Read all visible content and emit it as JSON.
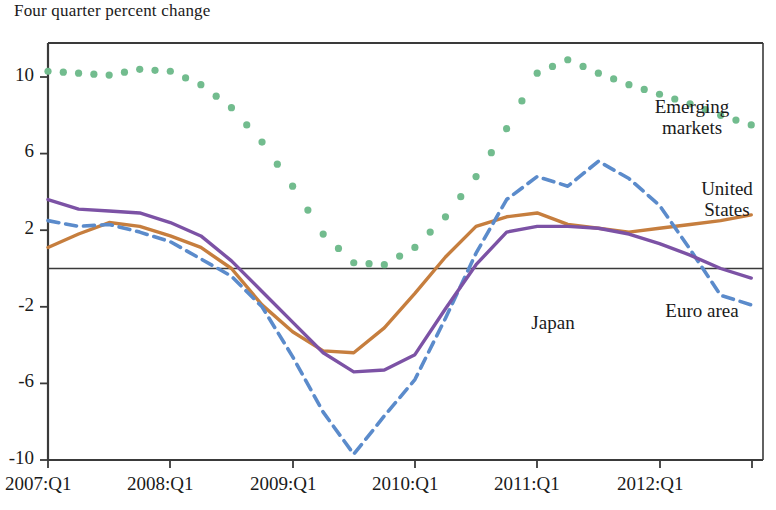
{
  "chart_data": {
    "type": "line",
    "title": "Four quarter percent change",
    "xlabel": "",
    "ylabel": "",
    "ylim": [
      -10,
      12.2
    ],
    "xlim": [
      "2007:Q1",
      "2013:Q1"
    ],
    "grid": false,
    "legend_position": "inline-annotations",
    "y_ticks": [
      10,
      6,
      2,
      -2,
      -6,
      -10
    ],
    "y_tick_labels": [
      "10",
      "6",
      "2",
      "-2",
      "-6",
      "-10"
    ],
    "x_ticks": [
      "2007:Q1",
      "2008:Q1",
      "2009:Q1",
      "2010:Q1",
      "2011:Q1",
      "2012:Q1",
      "2013:Q1"
    ],
    "x_tick_labels": [
      "2007:Q1",
      "2008:Q1",
      "2009:Q1",
      "2010:Q1",
      "2011:Q1",
      "2012:Q1",
      ""
    ],
    "zero_line": true,
    "x": [
      "2007:Q1",
      "2007:Q2",
      "2007:Q3",
      "2007:Q4",
      "2008:Q1",
      "2008:Q2",
      "2008:Q3",
      "2008:Q4",
      "2009:Q1",
      "2009:Q2",
      "2009:Q3",
      "2009:Q4",
      "2010:Q1",
      "2010:Q2",
      "2010:Q3",
      "2010:Q4",
      "2011:Q1",
      "2011:Q2",
      "2011:Q3",
      "2011:Q4",
      "2012:Q1",
      "2012:Q2",
      "2012:Q3",
      "2012:Q4"
    ],
    "series": [
      {
        "name": "Emerging markets",
        "color": "#72BC8E",
        "style": "dotted",
        "values": [
          10.3,
          10.2,
          10.1,
          10.4,
          10.3,
          9.6,
          8.4,
          6.6,
          4.3,
          1.8,
          0.3,
          0.2,
          1.1,
          2.7,
          4.8,
          7.3,
          10.2,
          10.9,
          10.2,
          9.6,
          9.1,
          8.6,
          8.0,
          7.5
        ]
      },
      {
        "name": "United States",
        "color": "#C67E3E",
        "style": "solid",
        "values": [
          1.1,
          1.8,
          2.4,
          2.2,
          1.7,
          1.1,
          0.0,
          -1.9,
          -3.3,
          -4.3,
          -4.4,
          -3.1,
          -1.3,
          0.6,
          2.2,
          2.7,
          2.9,
          2.3,
          2.1,
          1.9,
          2.1,
          2.3,
          2.5,
          2.8
        ]
      },
      {
        "name": "Japan",
        "color": "#5B8BCB",
        "style": "dashed",
        "values": [
          2.5,
          2.2,
          2.3,
          1.9,
          1.4,
          0.5,
          -0.4,
          -2.0,
          -4.6,
          -7.5,
          -9.7,
          -7.7,
          -5.8,
          -2.6,
          0.8,
          3.6,
          4.8,
          4.3,
          5.6,
          4.7,
          3.3,
          1.0,
          -1.4,
          -1.9
        ]
      },
      {
        "name": "Euro area",
        "color": "#7C52A5",
        "style": "solid",
        "values": [
          3.6,
          3.1,
          3.0,
          2.9,
          2.4,
          1.7,
          0.4,
          -1.2,
          -2.8,
          -4.4,
          -5.4,
          -5.3,
          -4.5,
          -2.1,
          0.2,
          1.9,
          2.2,
          2.2,
          2.1,
          1.8,
          1.3,
          0.7,
          0.0,
          -0.5
        ]
      }
    ],
    "annotations": [
      {
        "id": "emerging-markets-label",
        "text_lines": [
          "Emerging",
          "markets"
        ],
        "x_px": 692,
        "y_px": 96
      },
      {
        "id": "united-states-label",
        "text_lines": [
          "United",
          "States"
        ],
        "x_px": 727,
        "y_px": 178
      },
      {
        "id": "japan-label",
        "text_lines": [
          "Japan"
        ],
        "x_px": 553,
        "y_px": 312
      },
      {
        "id": "euro-area-label",
        "text_lines": [
          "Euro area"
        ],
        "x_px": 702,
        "y_px": 300
      }
    ]
  },
  "axes": {
    "y_labels": [
      {
        "text": "10",
        "y_px": 77
      },
      {
        "text": "6",
        "y_px": 153
      },
      {
        "text": "2",
        "y_px": 230
      },
      {
        "text": "-2",
        "y_px": 307
      },
      {
        "text": "-6",
        "y_px": 383
      },
      {
        "text": "-10",
        "y_px": 460
      }
    ],
    "x_labels": [
      {
        "text": "2007:Q1",
        "x_px": 48
      },
      {
        "text": "2008:Q1",
        "x_px": 170
      },
      {
        "text": "2009:Q1",
        "x_px": 293
      },
      {
        "text": "2010:Q1",
        "x_px": 415
      },
      {
        "text": "2011:Q1",
        "x_px": 537
      },
      {
        "text": "2012:Q1",
        "x_px": 660
      }
    ]
  },
  "colors": {
    "emerging_markets": "#72BC8E",
    "united_states": "#C67E3E",
    "japan": "#5B8BCB",
    "euro_area": "#7C52A5",
    "axis": "#3a3a3a",
    "text": "#1a1a1a"
  }
}
